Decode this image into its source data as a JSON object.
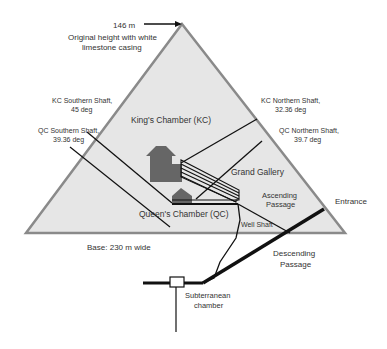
{
  "diagram": {
    "colors": {
      "pyramid_fill": "#e6e6e6",
      "pyramid_edge": "#8a8a8a",
      "line": "#111111",
      "chamber": "#666666",
      "text": "#333333"
    },
    "labels": {
      "height_value": "146 m",
      "height_note_1": "Original height with white",
      "height_note_2": "limestone casing",
      "kc_southern_1": "KC Southern Shaft,",
      "kc_southern_2": "45 deg",
      "qc_southern_1": "QC Southern Shaft,",
      "qc_southern_2": "39.36 deg",
      "kc_northern_1": "KC Northern Shaft,",
      "kc_northern_2": "32.36 deg",
      "qc_northern_1": "QC Northern Shaft,",
      "qc_northern_2": "39.7 deg",
      "kings_chamber": "King's Chamber (KC)",
      "grand_gallery": "Grand Gallery",
      "ascending_1": "Ascending",
      "ascending_2": "Passage",
      "queens_chamber": "Queen's Chamber (QC)",
      "well_shaft": "Well Shaft",
      "entrance": "Entrance",
      "base": "Base: 230 m wide",
      "descending_1": "Descending",
      "descending_2": "Passage",
      "subterranean_1": "Subterranean",
      "subterranean_2": "chamber"
    }
  }
}
